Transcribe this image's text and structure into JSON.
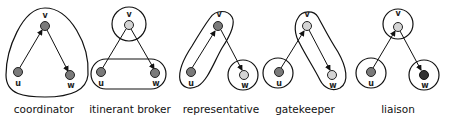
{
  "node_colors": {
    "dark": "#7a7a7a",
    "light": "#d4d4d4",
    "black": "#333333"
  },
  "panels": [
    {
      "name": "coordinator",
      "label": "coordinator",
      "nodes": {
        "v": {
          "label": "v",
          "shade": "dark"
        },
        "u": {
          "label": "u",
          "shade": "dark"
        },
        "w": {
          "label": "w",
          "shade": "dark"
        }
      },
      "edges": [
        [
          "u",
          "v"
        ],
        [
          "v",
          "w"
        ]
      ],
      "groups": [
        [
          "u",
          "v",
          "w"
        ]
      ]
    },
    {
      "name": "itinerant-broker",
      "label": "itinerant broker",
      "nodes": {
        "v": {
          "label": "v",
          "shade": "light"
        },
        "u": {
          "label": "u",
          "shade": "dark"
        },
        "w": {
          "label": "w",
          "shade": "dark"
        }
      },
      "edges": [
        [
          "u",
          "v"
        ],
        [
          "v",
          "w"
        ]
      ],
      "groups": [
        [
          "v"
        ],
        [
          "u",
          "w"
        ]
      ]
    },
    {
      "name": "representative",
      "label": "representative",
      "nodes": {
        "v": {
          "label": "v",
          "shade": "dark"
        },
        "u": {
          "label": "u",
          "shade": "dark"
        },
        "w": {
          "label": "w",
          "shade": "light"
        }
      },
      "edges": [
        [
          "u",
          "v"
        ],
        [
          "v",
          "w"
        ]
      ],
      "groups": [
        [
          "u",
          "v"
        ],
        [
          "w"
        ]
      ]
    },
    {
      "name": "gatekeeper",
      "label": "gatekeeper",
      "nodes": {
        "v": {
          "label": "v",
          "shade": "light"
        },
        "u": {
          "label": "u",
          "shade": "dark"
        },
        "w": {
          "label": "w",
          "shade": "light"
        }
      },
      "edges": [
        [
          "u",
          "v"
        ],
        [
          "v",
          "w"
        ]
      ],
      "groups": [
        [
          "u"
        ],
        [
          "v",
          "w"
        ]
      ]
    },
    {
      "name": "liaison",
      "label": "liaison",
      "nodes": {
        "v": {
          "label": "v",
          "shade": "light"
        },
        "u": {
          "label": "u",
          "shade": "dark"
        },
        "w": {
          "label": "w",
          "shade": "black"
        }
      },
      "edges": [
        [
          "u",
          "v"
        ],
        [
          "v",
          "w"
        ]
      ],
      "groups": [
        [
          "u"
        ],
        [
          "v"
        ],
        [
          "w"
        ]
      ]
    }
  ]
}
